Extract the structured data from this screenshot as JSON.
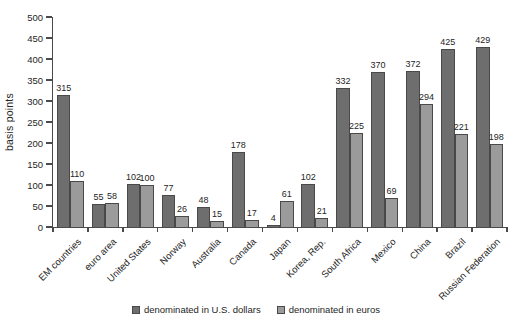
{
  "chart_data": {
    "type": "bar",
    "title": "",
    "xlabel": "",
    "ylabel": "basis points",
    "ylim": [
      0,
      500
    ],
    "ytick_step": 50,
    "grid": false,
    "legend_position": "bottom",
    "categories": [
      "EM countries",
      "euro area",
      "United States",
      "Norway",
      "Australia",
      "Canada",
      "Japan",
      "Korea, Rep.",
      "South Africa",
      "Mexico",
      "China",
      "Brazil",
      "Russian Federation"
    ],
    "series": [
      {
        "name": "denominated in U.S. dollars",
        "color": "#6e6e6e",
        "values": [
          315,
          55,
          102,
          77,
          48,
          178,
          4,
          102,
          332,
          370,
          372,
          425,
          429
        ]
      },
      {
        "name": "denominated in euros",
        "color": "#9b9b9b",
        "values": [
          110,
          58,
          100,
          26,
          15,
          17,
          61,
          21,
          225,
          69,
          294,
          221,
          198
        ]
      }
    ],
    "value_labels_shown": true,
    "axis_color": "#4a4a4a",
    "text_color": "#262626"
  }
}
